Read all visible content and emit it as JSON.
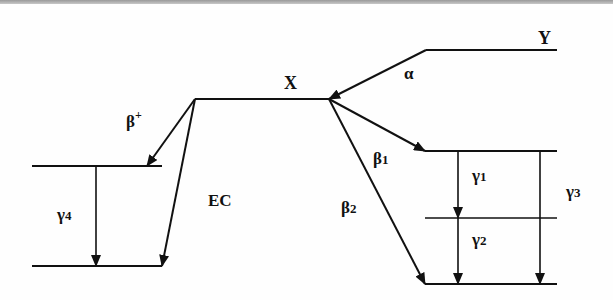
{
  "diagram": {
    "title": "",
    "type": "nuclear-decay-scheme",
    "colors": {
      "line": "#111111",
      "background": "#fefefe",
      "border": "#a8a8a8"
    },
    "nuclides": [
      {
        "id": "Y",
        "label": "Y"
      },
      {
        "id": "X",
        "label": "X"
      }
    ],
    "transitions": {
      "alpha": {
        "label": "α",
        "from": "Y",
        "to": "X"
      },
      "beta_plus": {
        "label": "β",
        "sup": "+",
        "from": "X",
        "to": "left-upper-level"
      },
      "ec": {
        "label": "EC",
        "from": "X",
        "to": "left-lower-level"
      },
      "beta1": {
        "label": "β",
        "sub": "1",
        "from": "X",
        "to": "right-top-level"
      },
      "beta2": {
        "label": "β",
        "sub": "2",
        "from": "X",
        "to": "right-bottom-level"
      },
      "gamma1": {
        "label": "γ",
        "sub": "1",
        "from": "right-top-level",
        "to": "right-middle-level"
      },
      "gamma2": {
        "label": "γ",
        "sub": "2",
        "from": "right-middle-level",
        "to": "right-bottom-level"
      },
      "gamma3": {
        "label": "γ",
        "sub": "3",
        "from": "right-top-level",
        "to": "right-bottom-level"
      },
      "gamma4": {
        "label": "γ",
        "sub": "4",
        "from": "left-upper-level",
        "to": "left-lower-level"
      }
    }
  }
}
